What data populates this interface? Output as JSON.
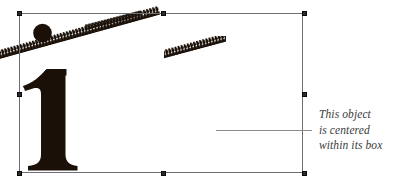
{
  "canvas": {
    "width": 398,
    "height": 183,
    "background": "#ffffff"
  },
  "selection": {
    "name": "object-bounding-box",
    "stroke_color": "#6e6e72",
    "handle_color": "#2b2b2e",
    "x": 19,
    "y": 13,
    "width": 284,
    "height": 160,
    "handles": [
      {
        "id": "top-left",
        "position": "top-left"
      },
      {
        "id": "top-center",
        "position": "top-center"
      },
      {
        "id": "top-right",
        "position": "top-right"
      },
      {
        "id": "middle-left",
        "position": "middle-left"
      },
      {
        "id": "middle-right",
        "position": "middle-right"
      },
      {
        "id": "bottom-left",
        "position": "bottom-left"
      },
      {
        "id": "bottom-center",
        "position": "bottom-center"
      },
      {
        "id": "bottom-right",
        "position": "bottom-right"
      }
    ]
  },
  "artwork": {
    "glyph": "i",
    "glyph_color": "#1a1008",
    "dot_color": "#1a1008",
    "ribbon_color": "#1a1008",
    "ribbons": [
      {
        "id": "ribbon-long",
        "description": "long diagonal sawtooth band"
      },
      {
        "id": "ribbon-short",
        "description": "short diagonal sawtooth band"
      }
    ]
  },
  "annotation": {
    "leader_line_color": "#8a8a8e",
    "text_color": "#3a3a3c",
    "lines": [
      "This object",
      "is centered",
      "within its box"
    ]
  }
}
